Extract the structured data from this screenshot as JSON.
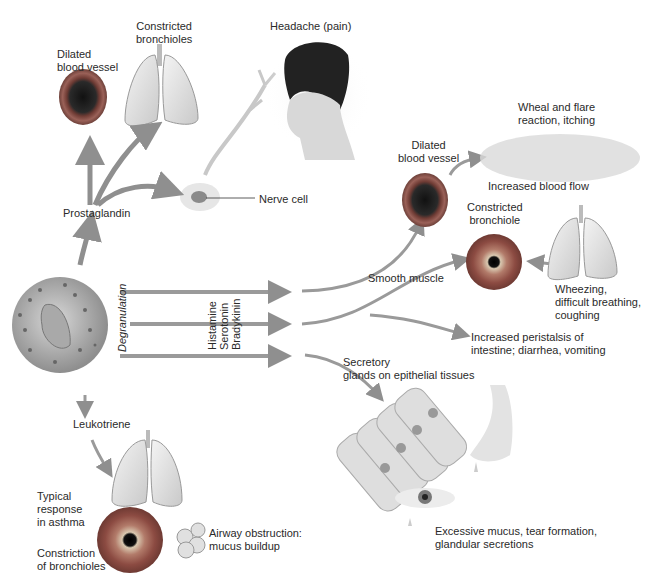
{
  "diagram": {
    "source_cell": "Mast cell",
    "process": "Degranulation",
    "mediators": [
      "Histamine",
      "Serotonin",
      "Bradykinin"
    ],
    "colors": {
      "arrow": "#8f8f8f",
      "vessel_outer": "#8a4e45",
      "vessel_inner": "#1a1a1a",
      "lung": "#e4e4e4",
      "text": "#2a2a2a"
    }
  },
  "labels": {
    "top_vessel": "Dilated\nblood vessel",
    "top_lungs": "Constricted\nbronchioles",
    "headache": "Headache (pain)",
    "nerve_cell": "Nerve cell",
    "prostaglandin": "Prostaglandin",
    "degranulation": "Degranulation",
    "histamine": "Histamine",
    "serotonin": "Serotonin",
    "bradykinin": "Bradykinin",
    "right_vessel": "Dilated\nblood vessel",
    "wheal": "Wheal and flare\nreaction, itching",
    "blood_flow": "Increased blood flow",
    "constricted_bronchiole": "Constricted\nbronchiole",
    "smooth_muscle": "Smooth muscle",
    "wheezing": "Wheezing,\ndifficult breathing,\ncoughing",
    "peristalsis": "Increased peristalsis of\nintestine; diarrhea, vomiting",
    "secretory": "Secretory\nglands on epithelial tissues",
    "leukotriene": "Leukotriene",
    "typical_response": "Typical\nresponse\nin asthma",
    "constriction": "Constriction\nof bronchioles",
    "airway": "Airway obstruction:\nmucus buildup",
    "excessive_mucus": "Excessive mucus, tear formation,\nglandular secretions"
  }
}
